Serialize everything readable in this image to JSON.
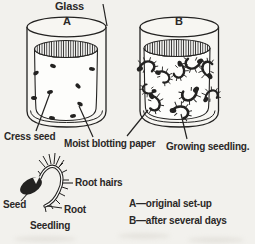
{
  "labels": {
    "glass": "Glass",
    "vessel_a": "A",
    "vessel_b": "B",
    "cress_seed": "Cress seed",
    "moist_blotting_paper": "Moist blotting paper",
    "growing_seedling": "Growing seedling.",
    "seed": "Seed",
    "root_hairs": "Root hairs",
    "root": "Root",
    "seedling": "Seedling"
  },
  "legend": {
    "a": "A—original set-up",
    "b": "B—after several days"
  },
  "colors": {
    "ink": "#232221",
    "background": "#f2f1ed",
    "glass_fill": "#f7f6f2",
    "paper_fill": "#fdfdfb",
    "text": "#2a2827"
  },
  "figure": {
    "description_a_seed_count": 9,
    "description_b_seedling_count": 10,
    "seeds_a": [
      {
        "x": 53,
        "y": 66,
        "r": 20
      },
      {
        "x": 36,
        "y": 73,
        "r": -30
      },
      {
        "x": 92,
        "y": 69,
        "r": 10
      },
      {
        "x": 78,
        "y": 86,
        "r": 45
      },
      {
        "x": 50,
        "y": 92,
        "r": -15
      },
      {
        "x": 34,
        "y": 98,
        "r": 5
      },
      {
        "x": 80,
        "y": 104,
        "r": 30
      },
      {
        "x": 52,
        "y": 118,
        "r": 10
      },
      {
        "x": 73,
        "y": 116,
        "r": -10
      }
    ],
    "seedlings_b": [
      {
        "x": 147,
        "y": 66,
        "r": -10,
        "s": 1
      },
      {
        "x": 164,
        "y": 76,
        "r": 40,
        "s": 0.9
      },
      {
        "x": 180,
        "y": 71,
        "r": 100,
        "s": 0.95
      },
      {
        "x": 193,
        "y": 64,
        "r": 170,
        "s": 1
      },
      {
        "x": 207,
        "y": 69,
        "r": 260,
        "s": 1
      },
      {
        "x": 148,
        "y": 90,
        "r": 200,
        "s": 0.8
      },
      {
        "x": 155,
        "y": 103,
        "r": 75,
        "s": 1
      },
      {
        "x": 190,
        "y": 95,
        "r": 150,
        "s": 1.05
      },
      {
        "x": 211,
        "y": 95,
        "r": -30,
        "s": 0.9
      },
      {
        "x": 181,
        "y": 111,
        "r": 15,
        "s": 1.05
      }
    ]
  }
}
